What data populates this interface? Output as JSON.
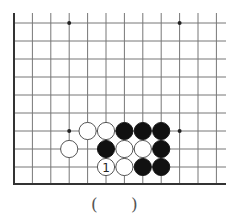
{
  "board": {
    "origin_x": 14,
    "origin_y": 23,
    "spacing_x": 18.4,
    "spacing_y": 18,
    "cols": 12,
    "rows": 9,
    "top_line_start_y": 13,
    "bottom_edge_y": 184,
    "right_end_x": 226,
    "line_color": "#777777",
    "edge_color": "#333333",
    "hoshi": [
      {
        "c": 3,
        "r": 0
      },
      {
        "c": 9,
        "r": 0
      },
      {
        "c": 3,
        "r": 6
      },
      {
        "c": 9,
        "r": 6
      }
    ],
    "stones": [
      {
        "c": 4,
        "r": 6,
        "color": "white"
      },
      {
        "c": 5,
        "r": 6,
        "color": "white"
      },
      {
        "c": 6,
        "r": 6,
        "color": "black"
      },
      {
        "c": 7,
        "r": 6,
        "color": "black"
      },
      {
        "c": 8,
        "r": 6,
        "color": "black"
      },
      {
        "c": 3,
        "r": 7,
        "color": "white"
      },
      {
        "c": 5,
        "r": 7,
        "color": "black"
      },
      {
        "c": 6,
        "r": 7,
        "color": "white"
      },
      {
        "c": 7,
        "r": 7,
        "color": "white"
      },
      {
        "c": 8,
        "r": 7,
        "color": "black"
      },
      {
        "c": 5,
        "r": 8,
        "color": "white",
        "label": "1"
      },
      {
        "c": 6,
        "r": 8,
        "color": "white"
      },
      {
        "c": 7,
        "r": 8,
        "color": "black"
      },
      {
        "c": 8,
        "r": 8,
        "color": "black"
      }
    ]
  },
  "caption": {
    "open": "(",
    "close": ")"
  }
}
